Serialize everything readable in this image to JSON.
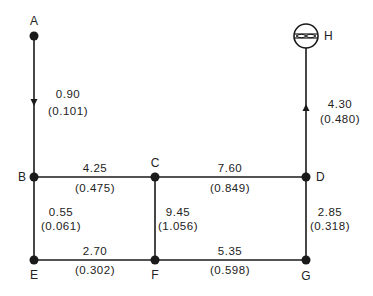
{
  "diagram": {
    "type": "pipe-network",
    "colors": {
      "line": "#1a1a1a",
      "text": "#222222",
      "background": "#ffffff"
    },
    "nodes": [
      {
        "id": "A",
        "label": "A",
        "symbol": "dot"
      },
      {
        "id": "B",
        "label": "B",
        "symbol": "dot"
      },
      {
        "id": "C",
        "label": "C",
        "symbol": "dot"
      },
      {
        "id": "D",
        "label": "D",
        "symbol": "dot"
      },
      {
        "id": "E",
        "label": "E",
        "symbol": "dot"
      },
      {
        "id": "F",
        "label": "F",
        "symbol": "dot"
      },
      {
        "id": "G",
        "label": "G",
        "symbol": "dot"
      },
      {
        "id": "H",
        "label": "H",
        "symbol": "fixture-circle"
      }
    ],
    "edges": [
      {
        "from": "A",
        "to": "B",
        "value": "0.90",
        "sub": "(0.101)",
        "arrow": "down"
      },
      {
        "from": "B",
        "to": "C",
        "value": "4.25",
        "sub": "(0.475)"
      },
      {
        "from": "C",
        "to": "D",
        "value": "7.60",
        "sub": "(0.849)"
      },
      {
        "from": "B",
        "to": "E",
        "value": "0.55",
        "sub": "(0.061)"
      },
      {
        "from": "C",
        "to": "F",
        "value": "9.45",
        "sub": "(1.056)"
      },
      {
        "from": "D",
        "to": "G",
        "value": "2.85",
        "sub": "(0.318)"
      },
      {
        "from": "E",
        "to": "F",
        "value": "2.70",
        "sub": "(0.302)"
      },
      {
        "from": "F",
        "to": "G",
        "value": "5.35",
        "sub": "(0.598)"
      },
      {
        "from": "D",
        "to": "H",
        "value": "4.30",
        "sub": "(0.480)",
        "arrow": "up"
      }
    ]
  }
}
